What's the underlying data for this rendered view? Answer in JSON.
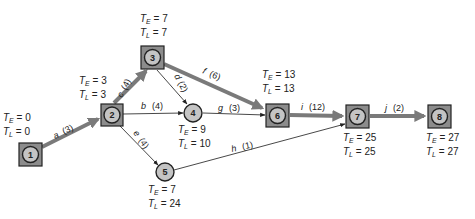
{
  "colors": {
    "critical_arrow": "#7a7a7a",
    "normal_arrow": "#333333",
    "node_box_fill": "#8c8c8c",
    "node_circle_fill": "#c4c4c4",
    "stroke": "#222222"
  },
  "nodes": [
    {
      "id": "1",
      "shape": "box",
      "cx": 30,
      "cy": 154,
      "te": "0",
      "tl": "0"
    },
    {
      "id": "2",
      "shape": "box",
      "cx": 111,
      "cy": 115,
      "te": "3",
      "tl": "3"
    },
    {
      "id": "3",
      "shape": "box",
      "cx": 152,
      "cy": 57,
      "te": "7",
      "tl": "7"
    },
    {
      "id": "4",
      "shape": "circle",
      "cx": 193,
      "cy": 113,
      "te": "9",
      "tl": "10"
    },
    {
      "id": "5",
      "shape": "circle",
      "cx": 165,
      "cy": 172,
      "te": "7",
      "tl": "24"
    },
    {
      "id": "6",
      "shape": "box",
      "cx": 277,
      "cy": 115,
      "te": "13",
      "tl": "13"
    },
    {
      "id": "7",
      "shape": "box",
      "cx": 357,
      "cy": 116,
      "te": "25",
      "tl": "25"
    },
    {
      "id": "8",
      "shape": "box",
      "cx": 440,
      "cy": 116,
      "te": "27",
      "tl": "27"
    }
  ],
  "activities": [
    {
      "name": "a",
      "duration": "(3)",
      "from": "1",
      "to": "2",
      "critical": true
    },
    {
      "name": "b",
      "duration": "(4)",
      "from": "2",
      "to": "4",
      "critical": false
    },
    {
      "name": "c",
      "duration": "(4)",
      "from": "2",
      "to": "3",
      "critical": true
    },
    {
      "name": "d",
      "duration": "(2)",
      "from": "3",
      "to": "4",
      "critical": false
    },
    {
      "name": "e",
      "duration": "(4)",
      "from": "2",
      "to": "5",
      "critical": false
    },
    {
      "name": "f",
      "duration": "(6)",
      "from": "3",
      "to": "6",
      "critical": true
    },
    {
      "name": "g",
      "duration": "(3)",
      "from": "4",
      "to": "6",
      "critical": false
    },
    {
      "name": "h",
      "duration": "(1)",
      "from": "5",
      "to": "7",
      "critical": false
    },
    {
      "name": "i",
      "duration": "(12)",
      "from": "6",
      "to": "7",
      "critical": true
    },
    {
      "name": "j",
      "duration": "(2)",
      "from": "7",
      "to": "8",
      "critical": true
    }
  ],
  "labels": {
    "te_symbol": "T",
    "te_sub": "E",
    "tl_symbol": "T",
    "tl_sub": "L",
    "equals": " = "
  }
}
